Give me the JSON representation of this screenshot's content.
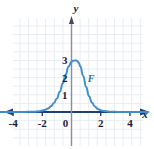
{
  "figure": {
    "background_color": "#ffffff",
    "grid_color": "#e9eef3",
    "axis_color": "#1f3f7a",
    "curve_color": "#3f8ecd",
    "label_color": "#1b1b3a"
  },
  "axes": {
    "x_label": "x",
    "y_label": "y"
  },
  "chart_data": {
    "type": "line",
    "title": "",
    "xlabel": "x",
    "ylabel": "y",
    "grid": true,
    "legend": "none",
    "xlim": [
      -5.2,
      5.2
    ],
    "ylim": [
      -0.9,
      4.2
    ],
    "xticks": [
      -4,
      -2,
      0,
      2,
      4
    ],
    "xtick_labels": [
      "-4",
      "-2",
      "0",
      "2",
      "4"
    ],
    "yticks": [
      1,
      2,
      3
    ],
    "ytick_labels": [
      "1",
      "2",
      "3"
    ],
    "series": [
      {
        "name": "F",
        "annotation": "F",
        "annotation_x": 1.35,
        "annotation_y": 1.75,
        "color": "#3f8ecd",
        "x": [
          -5.2,
          -4.6,
          -4.0,
          -3.4,
          -3.0,
          -2.6,
          -2.2,
          -2.0,
          -1.8,
          -1.6,
          -1.4,
          -1.2,
          -1.0,
          -0.8,
          -0.6,
          -0.4,
          -0.2,
          0.0,
          0.1,
          0.2,
          0.3,
          0.4,
          0.5,
          0.6,
          0.8,
          1.0,
          1.2,
          1.4,
          1.6,
          1.8,
          2.0,
          2.2,
          2.6,
          3.0,
          3.4,
          4.0,
          4.6,
          5.2
        ],
        "y": [
          0.0,
          0.0,
          0.0,
          0.0,
          0.01,
          0.02,
          0.05,
          0.08,
          0.13,
          0.21,
          0.33,
          0.52,
          0.79,
          1.18,
          1.66,
          2.18,
          2.65,
          2.92,
          2.98,
          3.0,
          3.0,
          2.97,
          2.86,
          2.66,
          2.1,
          1.45,
          0.92,
          0.55,
          0.32,
          0.18,
          0.1,
          0.06,
          0.02,
          0.01,
          0.0,
          0.0,
          0.0,
          0.0
        ]
      }
    ]
  }
}
